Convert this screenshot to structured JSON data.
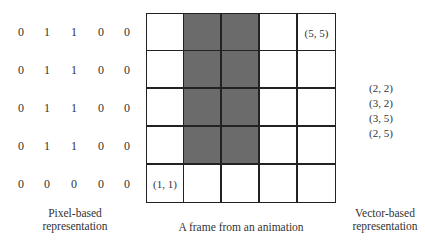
{
  "pixel_representation": {
    "rows": [
      [
        "0",
        "1",
        "1",
        "0",
        "0"
      ],
      [
        "0",
        "1",
        "1",
        "0",
        "0"
      ],
      [
        "0",
        "1",
        "1",
        "0",
        "0"
      ],
      [
        "0",
        "1",
        "1",
        "0",
        "0"
      ],
      [
        "0",
        "0",
        "0",
        "0",
        "0"
      ]
    ],
    "caption_line1": "Pixel-based",
    "caption_line2": "representation"
  },
  "frame": {
    "rows": 5,
    "cols": 5,
    "filled_color": "#6b6b6b",
    "filled_cells": [
      [
        0,
        1
      ],
      [
        0,
        2
      ],
      [
        1,
        1
      ],
      [
        1,
        2
      ],
      [
        2,
        1
      ],
      [
        2,
        2
      ],
      [
        3,
        1
      ],
      [
        3,
        2
      ]
    ],
    "corner_labels": {
      "top_right": "(5, 5)",
      "bottom_left": "(1, 1)"
    },
    "caption": "A frame from an animation"
  },
  "vector_representation": {
    "points": [
      "(2, 2)",
      "(3, 2)",
      "(3, 5)",
      "(2, 5)"
    ],
    "caption_line1": "Vector-based",
    "caption_line2": "representation"
  }
}
